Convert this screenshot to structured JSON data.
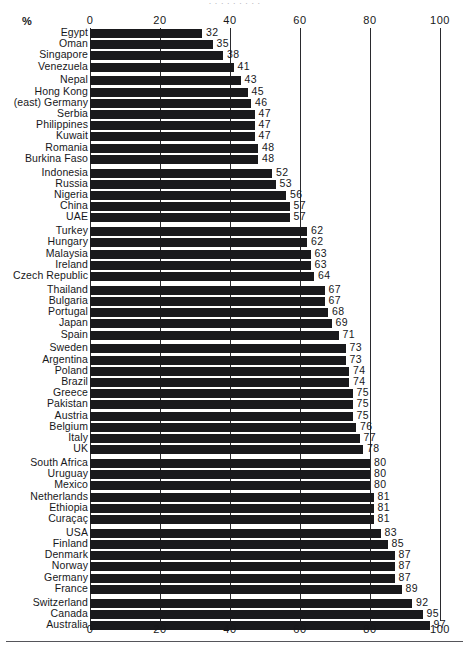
{
  "axis": {
    "unit_label": "%",
    "ticks": [
      0,
      20,
      40,
      60,
      80,
      100
    ],
    "tick_labels": [
      "0",
      "20",
      "40",
      "60",
      "80",
      "100"
    ],
    "min": 0,
    "max": 100
  },
  "top_cropped_text": "· · ·   ·  ·   ·  ·   ·  ·",
  "chart_data": {
    "type": "bar",
    "orientation": "horizontal",
    "title": "",
    "subtitle": "",
    "xlabel": "%",
    "ylabel": "",
    "xlim": [
      0,
      100
    ],
    "grid": true,
    "gridlines_at": [
      0,
      20,
      40,
      60,
      80,
      100
    ],
    "legend": [],
    "legend_position": "none",
    "sort": "ascending",
    "bar_color": "#19191c",
    "categories": [
      "Egypt",
      "Oman",
      "Singapore",
      "Venezuela",
      "Nepal",
      "Hong Kong",
      "(east) Germany",
      "Serbia",
      "Philippines",
      "Kuwait",
      "Romania",
      "Burkina Faso",
      "Indonesia",
      "Russia",
      "Nigeria",
      "China",
      "UAE",
      "Turkey",
      "Hungary",
      "Malaysia",
      "Ireland",
      "Czech Republic",
      "Thailand",
      "Bulgaria",
      "Portugal",
      "Japan",
      "Spain",
      "Sweden",
      "Argentina",
      "Poland",
      "Brazil",
      "Greece",
      "Pakistan",
      "Austria",
      "Belgium",
      "Italy",
      "UK",
      "South Africa",
      "Uruguay",
      "Mexico",
      "Netherlands",
      "Ethiopia",
      "Curaçaç",
      "USA",
      "Finland",
      "Denmark",
      "Norway",
      "Germany",
      "France",
      "Switzerland",
      "Canada",
      "Australia"
    ],
    "values": [
      32,
      35,
      38,
      41,
      43,
      45,
      46,
      47,
      47,
      47,
      48,
      48,
      52,
      53,
      56,
      57,
      57,
      62,
      62,
      63,
      63,
      64,
      67,
      67,
      68,
      69,
      71,
      73,
      73,
      74,
      74,
      75,
      75,
      75,
      76,
      77,
      78,
      80,
      80,
      80,
      81,
      81,
      81,
      83,
      85,
      87,
      87,
      87,
      89,
      92,
      95,
      97
    ],
    "value_labels": [
      "32",
      "35",
      "38",
      "41",
      "43",
      "45",
      "46",
      "47",
      "47",
      "47",
      "48",
      "48",
      "52",
      "53",
      "56",
      "57",
      "57",
      "62",
      "62",
      "63",
      "63",
      "64",
      "67",
      "67",
      "68",
      "69",
      "71",
      "73",
      "73",
      "74",
      "74",
      "75",
      "75",
      "75",
      "76",
      "77",
      "78",
      "80",
      "80",
      "80",
      "81",
      "81",
      "81",
      "83",
      "85",
      "87",
      "87",
      "87",
      "89",
      "92",
      "95",
      "97"
    ],
    "group_breaks_after_index": [
      3,
      11,
      16,
      21,
      26,
      36,
      42,
      48
    ]
  }
}
